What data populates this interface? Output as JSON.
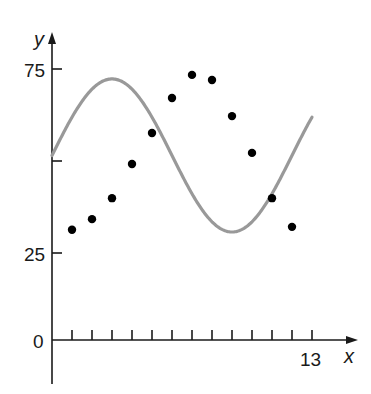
{
  "chart_data": {
    "type": "scatter",
    "title": "",
    "xlabel": "x",
    "ylabel": "y",
    "x_ticks": [
      1,
      2,
      3,
      4,
      5,
      6,
      7,
      8,
      9,
      10,
      11,
      12,
      13
    ],
    "x_tick_labels_shown": [
      {
        "value": 13,
        "label": "13"
      }
    ],
    "y_ticks": [
      0,
      25,
      50,
      75
    ],
    "y_tick_labels_shown": [
      {
        "value": 0,
        "label": "0"
      },
      {
        "value": 25,
        "label": "25"
      },
      {
        "value": 75,
        "label": "75"
      }
    ],
    "xlim": [
      0,
      14
    ],
    "ylim": [
      0,
      80
    ],
    "grid": false,
    "legend": null,
    "series": [
      {
        "name": "data points",
        "type": "scatter",
        "color": "#000000",
        "x": [
          1,
          2,
          3,
          4,
          5,
          6,
          7,
          8,
          9,
          10,
          11,
          12
        ],
        "y": [
          31.3,
          34.2,
          39.9,
          49.2,
          57.6,
          67.1,
          73.4,
          72.0,
          62.2,
          52.2,
          39.9,
          32.1
        ]
      },
      {
        "name": "sinusoidal fit",
        "type": "line",
        "color": "#999999",
        "equation": "y = 20.8 sin((pi/6)x) + 51.5",
        "amplitude": 20.8,
        "period": 12,
        "phase_shift": 0,
        "vertical_shift": 51.5,
        "x_range": [
          0,
          13
        ]
      }
    ]
  },
  "labels": {
    "y_axis": "y",
    "x_axis": "x",
    "tick_75": "75",
    "tick_25": "25",
    "tick_0": "0",
    "tick_13": "13"
  },
  "layout": {
    "origin_px": [
      52,
      340
    ],
    "x_px_per_unit": 20,
    "y_px_at_25": 253,
    "y_px_per_unit_above_25": 3.68
  }
}
